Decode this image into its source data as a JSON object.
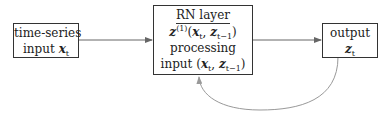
{
  "nodes": {
    "input": {
      "line1": "time-series",
      "line2_prefix": "input ",
      "var": "x",
      "sub": "t"
    },
    "rn_layer": {
      "title": "RN layer",
      "func_var": "z",
      "func_sup": "(1)",
      "func_args": "(x_t, z_{t-1})",
      "processing": "processing",
      "input_prefix": "input ",
      "input_args": "(x_t, z_{t-1})"
    },
    "output": {
      "line1": "output",
      "var": "z",
      "sub": "t"
    }
  },
  "edges": [
    {
      "from": "input",
      "to": "rn_layer",
      "type": "arrow"
    },
    {
      "from": "rn_layer",
      "to": "output",
      "type": "arrow"
    },
    {
      "from": "output",
      "to": "rn_layer",
      "type": "recurrent-feedback-arrow"
    }
  ],
  "colors": {
    "box_border": "#333333",
    "arrow": "#666666",
    "feedback_arrow": "#999999"
  }
}
